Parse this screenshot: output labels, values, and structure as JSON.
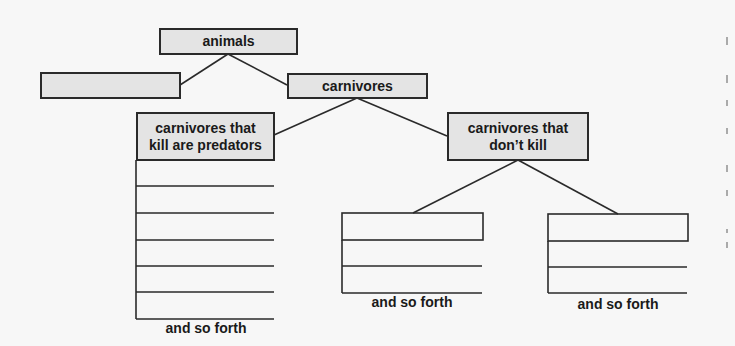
{
  "diagram": {
    "root": {
      "label": "animals"
    },
    "level1": [
      {
        "label": ""
      },
      {
        "label": "carnivores"
      }
    ],
    "level2": [
      {
        "label_line1": "carnivores that",
        "label_line2": "kill are predators"
      },
      {
        "label_line1": "carnivores that",
        "label_line2": "don’t kill"
      }
    ],
    "captions": {
      "predators": "and so forth",
      "dontkill_left": "and so forth",
      "dontkill_right": "and so forth"
    },
    "colors": {
      "box_fill": "#e4e4e4",
      "line": "#2a2a2a",
      "background": "#f7f7f7"
    }
  }
}
